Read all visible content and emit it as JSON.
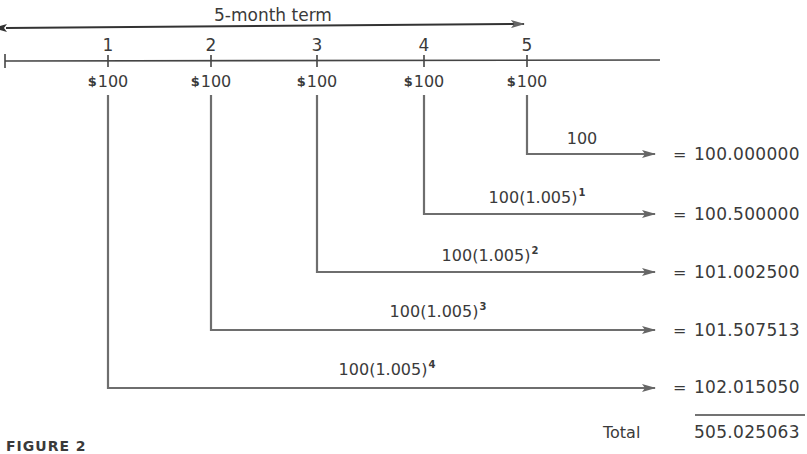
{
  "term": {
    "label": "5-month term"
  },
  "timeline": {
    "periods": [
      {
        "number": "1",
        "amount": "100",
        "currency": "$"
      },
      {
        "number": "2",
        "amount": "100",
        "currency": "$"
      },
      {
        "number": "3",
        "amount": "100",
        "currency": "$"
      },
      {
        "number": "4",
        "amount": "100",
        "currency": "$"
      },
      {
        "number": "5",
        "amount": "100",
        "currency": "$"
      }
    ]
  },
  "rows": [
    {
      "from_period": "5",
      "expression": "100",
      "exponent": "",
      "equals": "=",
      "value": "100.000000"
    },
    {
      "from_period": "4",
      "expression": "100(1.005)",
      "exponent": "1",
      "equals": "=",
      "value": "100.500000"
    },
    {
      "from_period": "3",
      "expression": "100(1.005)",
      "exponent": "2",
      "equals": "=",
      "value": "101.002500"
    },
    {
      "from_period": "2",
      "expression": "100(1.005)",
      "exponent": "3",
      "equals": "=",
      "value": "101.507513"
    },
    {
      "from_period": "1",
      "expression": "100(1.005)",
      "exponent": "4",
      "equals": "=",
      "value": "102.015050"
    }
  ],
  "total": {
    "label": "Total",
    "value": "505.025063"
  },
  "caption": "FIGURE 2",
  "colors": {
    "ink": "#3a3a3a",
    "arrow": "#6e6e6e",
    "background": "#ffffff"
  }
}
